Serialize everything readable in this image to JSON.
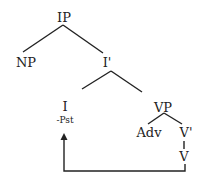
{
  "diagram": {
    "type": "syntax-tree",
    "nodes": {
      "ip": "IP",
      "np": "NP",
      "i_bar": "I'",
      "i": "I",
      "i_feature": "-Pst",
      "vp": "VP",
      "adv": "Adv",
      "v_bar": "V'",
      "v": "V"
    },
    "edges": [
      [
        "IP",
        "NP"
      ],
      [
        "IP",
        "I'"
      ],
      [
        "I'",
        "I"
      ],
      [
        "I'",
        "VP"
      ],
      [
        "VP",
        "Adv"
      ],
      [
        "VP",
        "V'"
      ],
      [
        "V'",
        "V"
      ]
    ],
    "movement_arrow": {
      "from": "V",
      "to": "I"
    },
    "colors": {
      "line": "#222222",
      "text": "#222222",
      "background": "#ffffff"
    }
  }
}
